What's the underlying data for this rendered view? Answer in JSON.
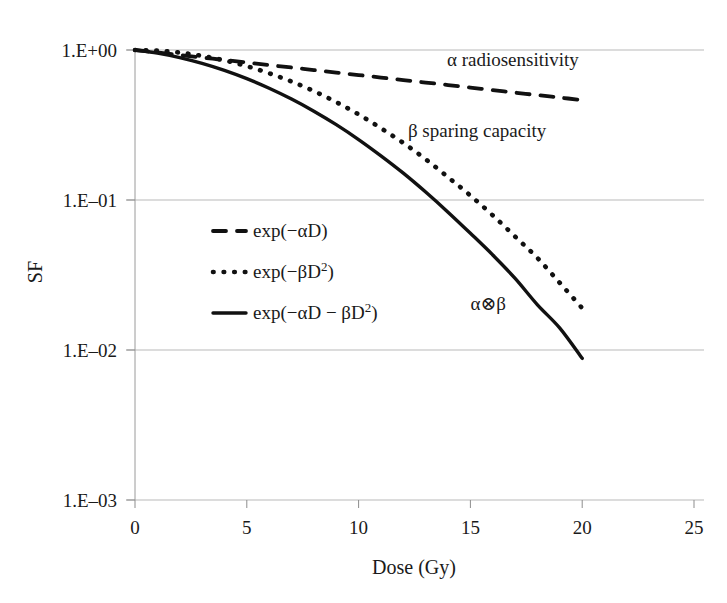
{
  "chart_data": {
    "type": "line",
    "title": "",
    "xlabel": "Dose (Gy)",
    "ylabel": "SF",
    "xlim": [
      0,
      25
    ],
    "ylim": [
      0.001,
      1
    ],
    "yscale": "log",
    "grid": true,
    "legend_position": "inside-left",
    "xticks": [
      "0",
      "5",
      "10",
      "15",
      "20",
      "25"
    ],
    "xtick_values": [
      0,
      5,
      10,
      15,
      20,
      25
    ],
    "yticks": [
      "1.E+00",
      "1.E–01",
      "1.E–02",
      "1.E–03"
    ],
    "ytick_values": [
      1,
      0.1,
      0.01,
      0.001
    ],
    "params": {
      "alpha": 0.0385,
      "beta": 0.0099
    },
    "series": [
      {
        "name": "exp(−αD)",
        "style": "dashed",
        "x": [
          0,
          1,
          2,
          3,
          4,
          5,
          6,
          7,
          8,
          9,
          10,
          11,
          12,
          13,
          14,
          15,
          16,
          17,
          18,
          19,
          20
        ],
        "y": [
          1.0,
          0.962,
          0.926,
          0.891,
          0.857,
          0.825,
          0.794,
          0.764,
          0.735,
          0.707,
          0.681,
          0.655,
          0.63,
          0.607,
          0.584,
          0.562,
          0.54,
          0.52,
          0.5,
          0.482,
          0.463
        ]
      },
      {
        "name": "exp(−βD²)",
        "style": "dotted",
        "x": [
          0,
          1,
          2,
          3,
          4,
          5,
          6,
          7,
          8,
          9,
          10,
          11,
          12,
          13,
          14,
          15,
          16,
          17,
          18,
          19,
          20
        ],
        "y": [
          1.0,
          0.99,
          0.961,
          0.914,
          0.853,
          0.78,
          0.7,
          0.616,
          0.532,
          0.449,
          0.372,
          0.301,
          0.24,
          0.187,
          0.142,
          0.107,
          0.079,
          0.057,
          0.041,
          0.028,
          0.019
        ]
      },
      {
        "name": "exp(−αD − βD²)",
        "style": "solid",
        "x": [
          0,
          1,
          2,
          3,
          4,
          5,
          6,
          7,
          8,
          9,
          10,
          11,
          12,
          13,
          14,
          15,
          16,
          17,
          18,
          19,
          20
        ],
        "y": [
          1.0,
          0.953,
          0.89,
          0.814,
          0.731,
          0.644,
          0.556,
          0.471,
          0.391,
          0.318,
          0.253,
          0.197,
          0.151,
          0.113,
          0.083,
          0.06,
          0.043,
          0.03,
          0.02,
          0.014,
          0.0088
        ]
      }
    ],
    "annotations": [
      {
        "text": "α radiosensitivity",
        "x": 16.9,
        "y": 0.78
      },
      {
        "text": "β sparing capacity",
        "x": 15.3,
        "y": 0.265
      },
      {
        "text": "α⊗β",
        "x": 15.8,
        "y": 0.0185
      }
    ]
  },
  "legend": {
    "items": [
      {
        "label_main": "exp(−αD)",
        "label_sup": "",
        "style": "dashed"
      },
      {
        "label_main": "exp(−βD",
        "label_sup": "2",
        "label_tail": ")",
        "style": "dotted"
      },
      {
        "label_main": "exp(−αD − βD",
        "label_sup": "2",
        "label_tail": ")",
        "style": "solid"
      }
    ]
  },
  "colors": {
    "curve": "#111111",
    "grid": "#b9b9b9",
    "axis": "#9a9a9a",
    "text": "#1a1a1a",
    "background": "#ffffff"
  }
}
